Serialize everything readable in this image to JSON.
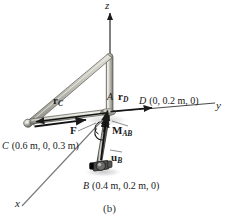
{
  "figure": {
    "caption": "(b)",
    "background_color": "#ffffff",
    "ink_color": "#1a1a1a",
    "member_color": "#b8b8b0"
  },
  "axes": [
    {
      "name": "z-axis",
      "label": "z",
      "direction": "up"
    },
    {
      "name": "y-axis",
      "label": "y",
      "direction": "right"
    },
    {
      "name": "x-axis",
      "label": "x",
      "direction": "down-left"
    }
  ],
  "points": {
    "A": {
      "label": "A"
    },
    "B": {
      "label": "B",
      "coords": "(0.4 m, 0.2 m, 0)"
    },
    "C": {
      "label": "C",
      "coords": "(0.6 m, 0, 0.3 m)"
    },
    "D": {
      "label": "D",
      "coords": "(0, 0.2 m, 0)"
    }
  },
  "vectors": {
    "rC": {
      "symbol": "r",
      "sub": "C"
    },
    "rD": {
      "symbol": "r",
      "sub": "D"
    },
    "F": {
      "symbol": "F",
      "sub": ""
    },
    "uB": {
      "symbol": "u",
      "sub": "B"
    },
    "MAB": {
      "symbol": "M",
      "sub": "AB"
    }
  }
}
